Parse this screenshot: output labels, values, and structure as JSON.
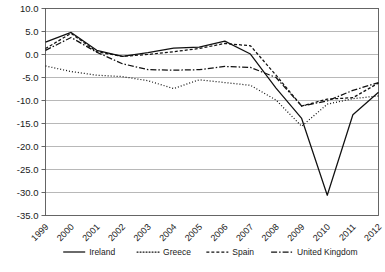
{
  "chart_data": {
    "type": "line",
    "title": "",
    "subtitle": "",
    "xlabel": "",
    "ylabel": "",
    "x": [
      1999,
      2000,
      2001,
      2002,
      2003,
      2004,
      2005,
      2006,
      2007,
      2008,
      2009,
      2010,
      2011,
      2012
    ],
    "categories": [
      "1999",
      "2000",
      "2001",
      "2002",
      "2003",
      "2004",
      "2005",
      "2006",
      "2007",
      "2008",
      "2009",
      "2010",
      "2011",
      "2012"
    ],
    "xlim": [
      1999,
      2012
    ],
    "ylim": [
      -35.0,
      10.0
    ],
    "ytick_labels": [
      "10.0",
      "5.0",
      "0.0",
      "-5.0",
      "-10.0",
      "-15.0",
      "-20.0",
      "-25.0",
      "-30.0",
      "-35.0"
    ],
    "ytick_values": [
      10.0,
      5.0,
      0.0,
      -5.0,
      -10.0,
      -15.0,
      -20.0,
      -25.0,
      -30.0,
      -35.0
    ],
    "grid": true,
    "grid_axis": "y",
    "legend_position": "bottom",
    "series": [
      {
        "name": "Ireland",
        "style": "solid",
        "dash": "none",
        "color": "#111111",
        "values": [
          2.7,
          4.8,
          0.9,
          -0.4,
          0.4,
          1.4,
          1.6,
          2.9,
          0.1,
          -7.3,
          -13.9,
          -30.6,
          -13.1,
          -8.2
        ]
      },
      {
        "name": "Greece",
        "style": "dotted",
        "dash": "1,2",
        "color": "#111111",
        "values": [
          -2.5,
          -3.7,
          -4.5,
          -4.8,
          -5.7,
          -7.4,
          -5.5,
          -6.1,
          -6.7,
          -9.9,
          -15.6,
          -10.8,
          -9.6,
          -9.0
        ]
      },
      {
        "name": "Spain",
        "style": "dashed",
        "dash": "3,2",
        "color": "#111111",
        "values": [
          1.3,
          4.6,
          0.6,
          -0.4,
          0.0,
          0.6,
          1.3,
          2.4,
          1.9,
          -4.5,
          -11.2,
          -9.7,
          -9.4,
          -6.2
        ]
      },
      {
        "name": "United Kingdom",
        "style": "dash-dot",
        "dash": "6,2,1.5,2",
        "color": "#111111",
        "values": [
          0.9,
          3.7,
          0.5,
          -2.0,
          -3.3,
          -3.4,
          -3.3,
          -2.6,
          -2.8,
          -5.0,
          -11.2,
          -10.1,
          -7.8,
          -6.1
        ]
      }
    ]
  },
  "legend": {
    "items": [
      {
        "label": "Ireland"
      },
      {
        "label": "Greece"
      },
      {
        "label": "Spain"
      },
      {
        "label": "United Kingdom"
      }
    ]
  }
}
